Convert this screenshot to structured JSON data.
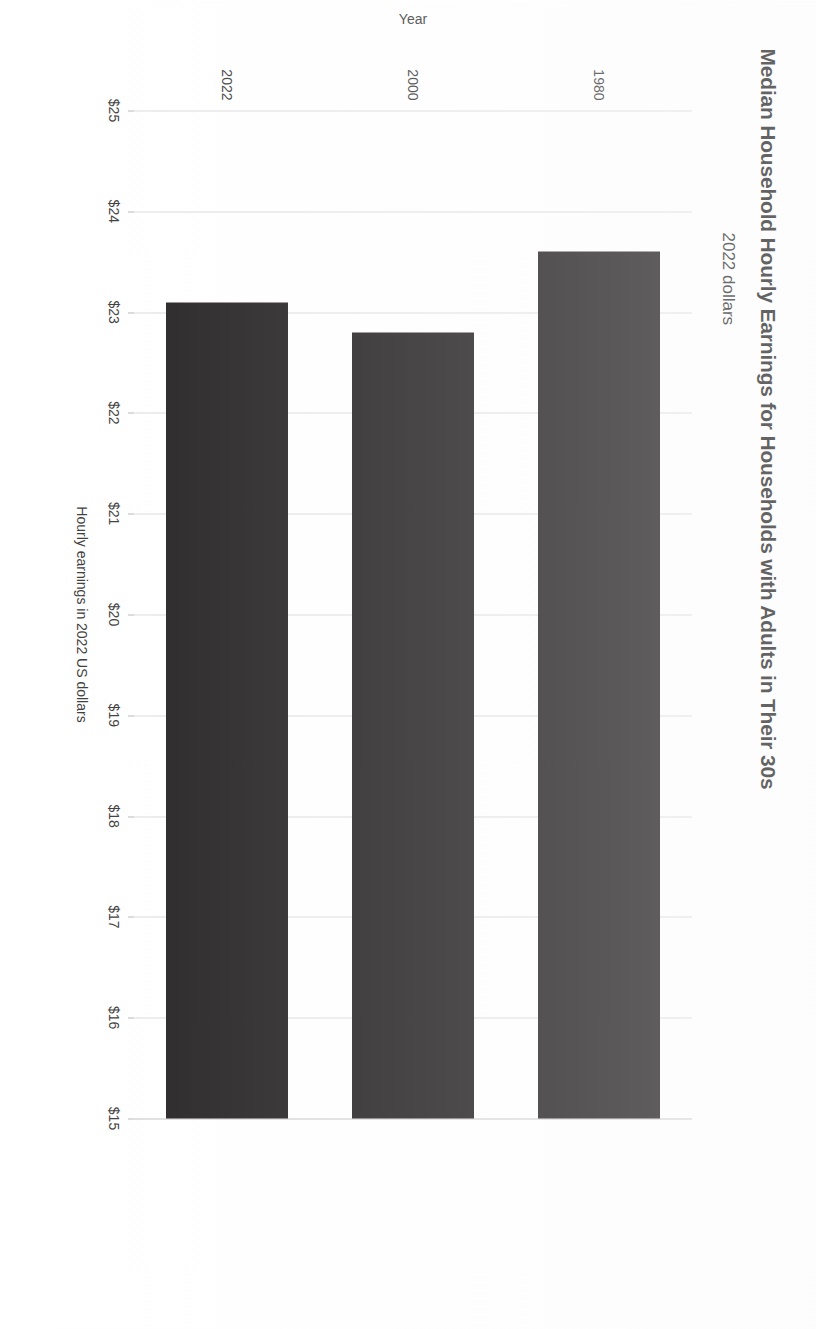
{
  "document": {
    "orientation_degrees": 90,
    "background_color": "#ffffff"
  },
  "chart_data": {
    "type": "bar",
    "orientation": "horizontal",
    "title": "Median Household Hourly Earnings for Households with Adults in Their 30s",
    "subtitle": "2022 dollars",
    "categories": [
      "1980",
      "2000",
      "2022"
    ],
    "values": [
      23.6,
      22.8,
      23.1
    ],
    "xlabel": "Year",
    "ylabel": "Hourly earnings in 2022 US dollars",
    "ylim": [
      15,
      25
    ],
    "tick_labels": [
      "$25",
      "$24",
      "$23",
      "$22",
      "$21",
      "$20",
      "$19",
      "$18",
      "$17",
      "$16",
      "$15"
    ],
    "tick_values": [
      25,
      24,
      23,
      22,
      21,
      20,
      19,
      18,
      17,
      16,
      15
    ],
    "grid": true,
    "legend": false,
    "bar_color": "#221f20",
    "gridline_color": "#d9d9d9"
  }
}
